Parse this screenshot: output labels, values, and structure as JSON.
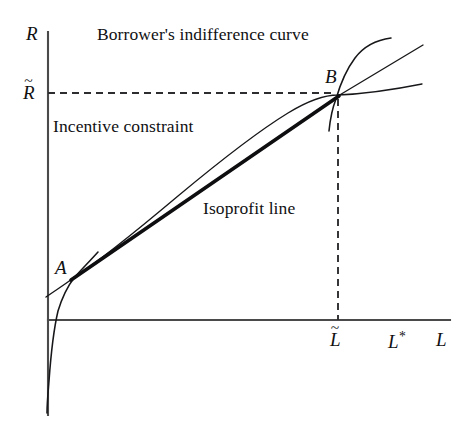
{
  "figure": {
    "domain": "diagram",
    "background_color": "#ffffff",
    "ink_color": "#101012",
    "axis_color": "#4a4a4a",
    "width": 473,
    "height": 431
  },
  "axes": {
    "y_axis_label": "R",
    "x_axis_label": "L",
    "y_axis": {
      "x": 48,
      "y_top": 32,
      "y_bottom": 415
    },
    "x_axis": {
      "y": 320,
      "x_left": 48,
      "x_right": 450
    }
  },
  "ticks": {
    "y": [
      {
        "label": "R",
        "accent": "tilde",
        "value_x": 30,
        "value_y": 93
      }
    ],
    "x": [
      {
        "label": "L",
        "accent": "tilde",
        "value_x": 338,
        "value_y": 340
      },
      {
        "label": "L",
        "accent": "star",
        "value_x": 394,
        "value_y": 340
      }
    ]
  },
  "labels": {
    "borrower_curve": "Borrower's indifference curve",
    "incentive_constraint": "Incentive constraint",
    "isoprofit_line": "Isoprofit line",
    "point_a": "A",
    "point_b": "B",
    "r_tilde": "R",
    "l_tilde": "L",
    "l_star": "L",
    "tilde_glyph": "~",
    "star_glyph": "*"
  },
  "points": [
    {
      "name": "A",
      "x": 72,
      "y": 279
    },
    {
      "name": "B",
      "x": 338,
      "y": 96
    }
  ],
  "guides": [
    {
      "name": "r-tilde-horizontal-guide",
      "style": "dashed",
      "from_x": 48,
      "from_y": 93,
      "to_x": 338,
      "to_y": 93
    },
    {
      "name": "l-tilde-vertical-guide",
      "style": "dashed",
      "from_x": 338,
      "from_y": 96,
      "to_x": 338,
      "to_y": 320
    }
  ],
  "curves": {
    "incentive_constraint": {
      "name": "incentive-constraint-curve",
      "style": "thin",
      "description": "concave increasing curve from lower-left through A and B then flattening to the right",
      "path": "M 46 297 C 58 288 66 284 74 278 C 110 255 150 220 190 185 C 230 150 275 118 310 102 C 322 96 330 94 338 96 C 360 90 390 86 420 84"
    },
    "borrower_indifference_through_b": {
      "name": "borrower-indifference-curve-b",
      "style": "steep",
      "description": "steep convex curve rising nearly vertically through B and bending right at the top",
      "path": "M 330 129 C 331 120 333 108 338 96 C 343 82 350 66 360 55 C 370 45 380 40 392 39"
    },
    "borrower_indifference_through_a": {
      "name": "borrower-indifference-curve-a",
      "style": "steep",
      "description": "steep curve through A descending below the horizontal axis near the vertical axis",
      "path": "M 96 255 C 88 264 80 272 74 279 C 68 287 63 297 59 310 C 55 325 52 350 50 380 C 49 392 48 402 48 412"
    },
    "isoprofit_line_thick": {
      "name": "isoprofit-line",
      "style": "thick",
      "description": "straight thick line from A to B",
      "from_x": 72,
      "from_y": 279,
      "to_x": 338,
      "to_y": 96
    },
    "isoprofit_line_extension": {
      "name": "isoprofit-line-extension",
      "style": "thin",
      "description": "thin continuation of the isoprofit line beyond B to the upper right",
      "from_x": 338,
      "from_y": 96,
      "to_x": 423,
      "to_y": 45
    },
    "incentive_tail_left": {
      "name": "incentive-constraint-left-tail",
      "style": "thin",
      "description": "short thin segment of incentive constraint left of A reaching the vertical axis",
      "from_x": 48,
      "from_y": 296,
      "to_x": 72,
      "to_y": 280
    }
  },
  "annotations": [
    {
      "name": "borrower-curve-label",
      "text": "Borrower's indifference curve",
      "x": 97,
      "y": 26
    },
    {
      "name": "incentive-constraint-label",
      "text": "Incentive constraint",
      "x": 52,
      "y": 118
    },
    {
      "name": "isoprofit-line-label",
      "text": "Isoprofit line",
      "x": 203,
      "y": 200
    },
    {
      "name": "point-a-label",
      "text": "A",
      "x": 56,
      "y": 258
    },
    {
      "name": "point-b-label",
      "text": "B",
      "x": 326,
      "y": 68
    },
    {
      "name": "y-axis-label",
      "text": "R",
      "x": 28,
      "y": 30
    },
    {
      "name": "x-axis-label",
      "text": "L",
      "x": 437,
      "y": 329
    }
  ]
}
